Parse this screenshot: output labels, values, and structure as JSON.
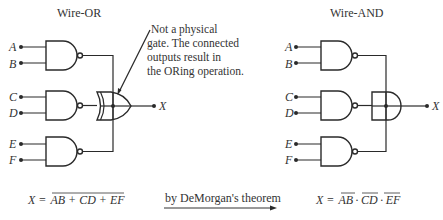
{
  "left_panel": {
    "title": "Wire-OR",
    "inputs": [
      "A",
      "B",
      "C",
      "D",
      "E",
      "F"
    ],
    "output": "X",
    "annotation_lines": [
      "Not a physical",
      "gate. The connected",
      "outputs result in",
      "the ORing operation."
    ],
    "equation": {
      "lhs": "X =",
      "rhs_overlined": "AB + CD + EF"
    }
  },
  "right_panel": {
    "title": "Wire-AND",
    "inputs": [
      "A",
      "B",
      "C",
      "D",
      "E",
      "F"
    ],
    "output": "X",
    "equation": {
      "lhs": "X =",
      "terms_overlined": [
        "AB",
        "CD",
        "EF"
      ],
      "separator": "·"
    }
  },
  "transform": {
    "label": "by DeMorgan's theorem",
    "arrow": "right-arrow"
  }
}
